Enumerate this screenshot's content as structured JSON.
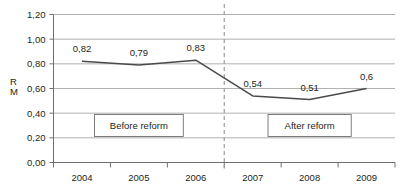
{
  "chart_data": {
    "type": "line",
    "title": "",
    "subtitle": "",
    "xlabel": "",
    "ylabel": "R M",
    "ylabel_lines": [
      "R",
      "M"
    ],
    "categories": [
      "2004",
      "2005",
      "2006",
      "2007",
      "2008",
      "2009"
    ],
    "values": [
      0.82,
      0.79,
      0.83,
      0.54,
      0.51,
      0.6
    ],
    "point_labels": [
      "0,82",
      "0,79",
      "0,83",
      "0,54",
      "0,51",
      "0,6"
    ],
    "ylim": [
      0,
      1.2
    ],
    "ytick_values": [
      0,
      0.2,
      0.4,
      0.6,
      0.8,
      1.0,
      1.2
    ],
    "ytick_labels": [
      "0,00",
      "0,20",
      "0,40",
      "0,60",
      "0,80",
      "1,00",
      "1,20"
    ],
    "grid": true,
    "grid_axis": "y",
    "legend": "none",
    "decimal_separator": ",",
    "series": [
      {
        "name": "R M",
        "values": [
          0.82,
          0.79,
          0.83,
          0.54,
          0.51,
          0.6
        ],
        "color": "#4a4a4a"
      }
    ],
    "annotations": [
      {
        "name": "before-reform",
        "text": "Before reform",
        "x_span": [
          "2004",
          "2006"
        ],
        "y": 0.3
      },
      {
        "name": "after-reform",
        "text": "After reform",
        "x_span": [
          "2007",
          "2009"
        ],
        "y": 0.3
      }
    ],
    "reference_lines": [
      {
        "name": "reform-divider",
        "orientation": "vertical",
        "between": [
          "2006",
          "2007"
        ],
        "style": "dashed",
        "color": "#9d9d9d"
      }
    ],
    "colors": {
      "series": "#4a4a4a",
      "grid": "#9d9d9d",
      "axis": "#6f6f6f",
      "text": "#231f20",
      "background": "#ffffff"
    }
  }
}
